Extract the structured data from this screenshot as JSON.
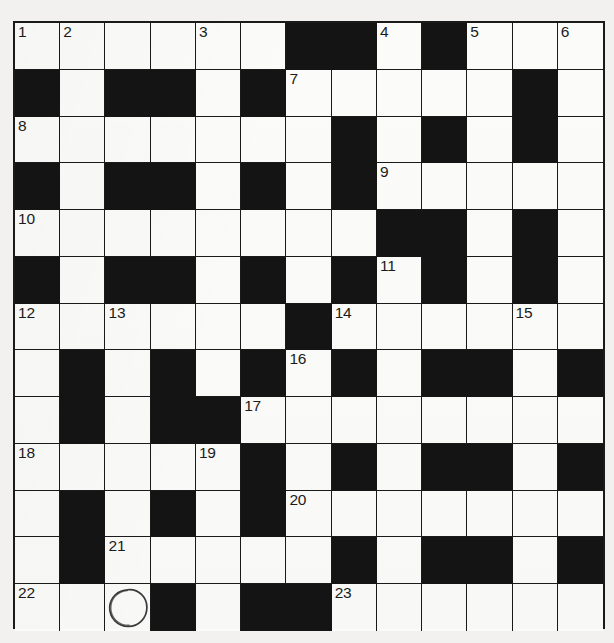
{
  "puzzle": {
    "type": "crossword-grid",
    "rows": 13,
    "cols": 13,
    "colors": {
      "block": "#141414",
      "cell": "#fbfbf9",
      "grid_line": "#1a1a1a",
      "page_background": "#f2f1ef",
      "number_text": "#1b1b1b",
      "annotation": "#3a3a3a"
    },
    "grid": [
      [
        "white",
        "white",
        "white",
        "white",
        "white",
        "white",
        "block",
        "block",
        "white",
        "block",
        "white",
        "white",
        "white"
      ],
      [
        "block",
        "white",
        "block",
        "block",
        "white",
        "block",
        "white",
        "white",
        "white",
        "white",
        "white",
        "block",
        "white"
      ],
      [
        "white",
        "white",
        "white",
        "white",
        "white",
        "white",
        "white",
        "block",
        "white",
        "block",
        "white",
        "block",
        "white"
      ],
      [
        "block",
        "white",
        "block",
        "block",
        "white",
        "block",
        "white",
        "block",
        "white",
        "white",
        "white",
        "white",
        "white"
      ],
      [
        "white",
        "white",
        "white",
        "white",
        "white",
        "white",
        "white",
        "white",
        "block",
        "block",
        "white",
        "block",
        "white"
      ],
      [
        "block",
        "white",
        "block",
        "block",
        "white",
        "block",
        "white",
        "block",
        "white",
        "block",
        "white",
        "block",
        "white"
      ],
      [
        "white",
        "white",
        "white",
        "white",
        "white",
        "white",
        "block",
        "white",
        "white",
        "white",
        "white",
        "white",
        "white"
      ],
      [
        "white",
        "block",
        "white",
        "block",
        "white",
        "block",
        "white",
        "block",
        "white",
        "block",
        "block",
        "white",
        "block"
      ],
      [
        "white",
        "block",
        "white",
        "block",
        "block",
        "white",
        "white",
        "white",
        "white",
        "white",
        "white",
        "white",
        "white"
      ],
      [
        "white",
        "white",
        "white",
        "white",
        "white",
        "block",
        "white",
        "block",
        "white",
        "block",
        "block",
        "white",
        "block"
      ],
      [
        "white",
        "block",
        "white",
        "block",
        "white",
        "block",
        "white",
        "white",
        "white",
        "white",
        "white",
        "white",
        "white"
      ],
      [
        "white",
        "block",
        "white",
        "white",
        "white",
        "white",
        "white",
        "block",
        "white",
        "block",
        "block",
        "white",
        "block"
      ],
      [
        "white",
        "white",
        "white",
        "block",
        "white",
        "block",
        "block",
        "white",
        "white",
        "white",
        "white",
        "white",
        "white"
      ]
    ],
    "numbers": [
      {
        "row": 0,
        "col": 0,
        "label": "1"
      },
      {
        "row": 0,
        "col": 1,
        "label": "2"
      },
      {
        "row": 0,
        "col": 4,
        "label": "3"
      },
      {
        "row": 0,
        "col": 8,
        "label": "4"
      },
      {
        "row": 0,
        "col": 10,
        "label": "5"
      },
      {
        "row": 0,
        "col": 12,
        "label": "6"
      },
      {
        "row": 1,
        "col": 6,
        "label": "7"
      },
      {
        "row": 2,
        "col": 0,
        "label": "8"
      },
      {
        "row": 3,
        "col": 8,
        "label": "9"
      },
      {
        "row": 4,
        "col": 0,
        "label": "10"
      },
      {
        "row": 5,
        "col": 8,
        "label": "11"
      },
      {
        "row": 6,
        "col": 0,
        "label": "12"
      },
      {
        "row": 6,
        "col": 2,
        "label": "13"
      },
      {
        "row": 6,
        "col": 7,
        "label": "14"
      },
      {
        "row": 6,
        "col": 11,
        "label": "15"
      },
      {
        "row": 7,
        "col": 6,
        "label": "16"
      },
      {
        "row": 8,
        "col": 5,
        "label": "17"
      },
      {
        "row": 9,
        "col": 0,
        "label": "18"
      },
      {
        "row": 9,
        "col": 4,
        "label": "19"
      },
      {
        "row": 10,
        "col": 6,
        "label": "20"
      },
      {
        "row": 11,
        "col": 2,
        "label": "21"
      },
      {
        "row": 12,
        "col": 0,
        "label": "22"
      },
      {
        "row": 12,
        "col": 7,
        "label": "23"
      }
    ],
    "annotations": [
      {
        "row": 12,
        "col": 2,
        "shape": "hand-drawn-circle",
        "name": "circle-annotation"
      }
    ]
  }
}
